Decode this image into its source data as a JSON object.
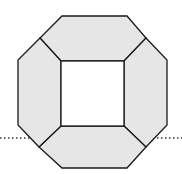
{
  "diagram": {
    "colors": {
      "panel_fill": "#e6e6e6",
      "stroke": "#1a1a1a",
      "hole_fill": "#ffffff",
      "dotted_line": "#333333"
    },
    "outer_octagon": [
      [
        62,
        16
      ],
      [
        127,
        16
      ],
      [
        167,
        60
      ],
      [
        167,
        125
      ],
      [
        127,
        168
      ],
      [
        62,
        168
      ],
      [
        18,
        125
      ],
      [
        18,
        60
      ]
    ],
    "inner_square": {
      "x": 61,
      "y": 61,
      "width": 63,
      "height": 65
    },
    "spoke_vertices": {
      "top_left": [
        40,
        38
      ],
      "top_right": [
        146,
        38
      ],
      "bottom_right": [
        146,
        147
      ],
      "bottom_left": [
        39,
        147
      ]
    },
    "dotted_line": {
      "y": 138,
      "left": [
        0,
        30
      ],
      "right": [
        153,
        182
      ]
    }
  }
}
